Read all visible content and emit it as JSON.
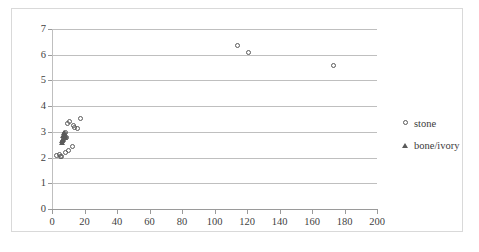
{
  "chart_data": {
    "type": "scatter",
    "title": "",
    "subtitle": "",
    "xlabel": "",
    "ylabel": "",
    "xlim": [
      0,
      200
    ],
    "ylim": [
      0,
      7
    ],
    "xticks": [
      0,
      20,
      40,
      60,
      80,
      100,
      120,
      140,
      160,
      180,
      200
    ],
    "yticks": [
      0,
      1,
      2,
      3,
      4,
      5,
      6,
      7
    ],
    "xtick_labels": [
      "0",
      "20",
      "40",
      "60",
      "80",
      "100",
      "120",
      "140",
      "160",
      "180",
      "200"
    ],
    "ytick_labels": [
      "0",
      "1",
      "2",
      "3",
      "4",
      "5",
      "6",
      "7"
    ],
    "grid": "horizontal",
    "legend_position": "right",
    "marker_color": "#5a5a5a",
    "gridline_color": "#bfbfbf",
    "axis_color": "#9a9a9a",
    "frame_color": "#d9d9d9",
    "background": "#ffffff",
    "series": [
      {
        "name": "stone",
        "marker": "circle",
        "points": [
          [
            2.5,
            2.08
          ],
          [
            4.5,
            2.12
          ],
          [
            5.0,
            2.03
          ],
          [
            6.0,
            2.06
          ],
          [
            6.5,
            2.62
          ],
          [
            7.0,
            2.72
          ],
          [
            7.5,
            2.93
          ],
          [
            8.0,
            2.97
          ],
          [
            8.5,
            2.78
          ],
          [
            9.0,
            2.8
          ],
          [
            9.5,
            3.34
          ],
          [
            8.0,
            2.2
          ],
          [
            10.0,
            2.26
          ],
          [
            11.0,
            3.4
          ],
          [
            12.5,
            2.43
          ],
          [
            13.0,
            3.25
          ],
          [
            14.0,
            3.18
          ],
          [
            15.5,
            3.12
          ],
          [
            17.5,
            3.52
          ],
          [
            114.0,
            6.35
          ],
          [
            121.0,
            6.07
          ],
          [
            173.0,
            5.57
          ]
        ]
      },
      {
        "name": "bone/ivory",
        "marker": "triangle",
        "points": [
          [
            6.0,
            2.58
          ],
          [
            6.3,
            2.63
          ],
          [
            6.8,
            2.7
          ],
          [
            7.0,
            2.82
          ],
          [
            7.2,
            2.88
          ],
          [
            7.5,
            2.95
          ],
          [
            7.8,
            2.75
          ],
          [
            8.0,
            2.85
          ]
        ]
      }
    ]
  },
  "legend": {
    "items": [
      {
        "label": "stone",
        "marker": "circle"
      },
      {
        "label": "bone/ivory",
        "marker": "triangle"
      }
    ]
  }
}
